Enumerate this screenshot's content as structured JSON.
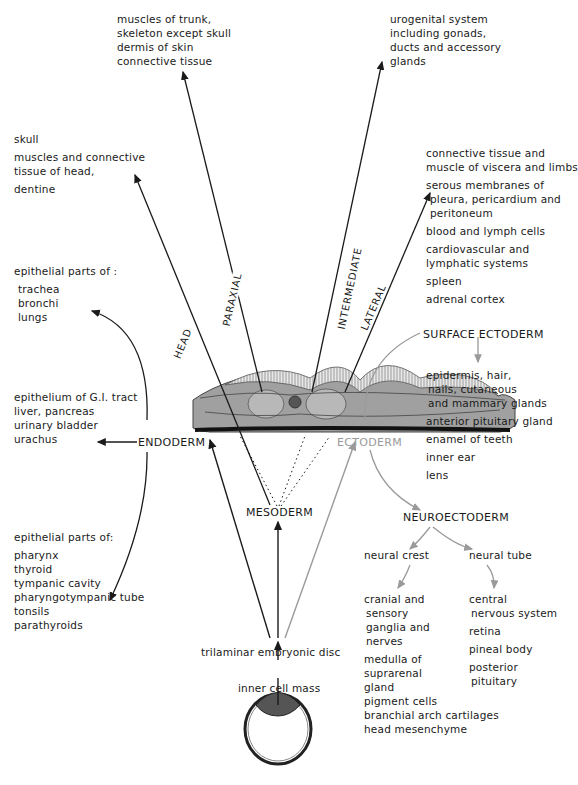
{
  "diagram": {
    "caption": "Derivatives of the germ layers from the inner cell mass via the trilaminar embryonic disc",
    "source_nodes": {
      "inner_cell_mass": "inner cell mass",
      "trilaminar_disc": "trilaminar embryonic disc"
    },
    "germ_layers": {
      "endoderm": "ENDODERM",
      "mesoderm": "MESODERM",
      "ectoderm": "ECTODERM"
    },
    "mesoderm_branches": {
      "head": "HEAD",
      "paraxial": "PARAXIAL",
      "intermediate": "INTERMEDIATE",
      "lateral": "LATERAL"
    },
    "mesoderm_derivatives": {
      "paraxial": [
        "muscles of trunk,",
        "skeleton except skull",
        "dermis of skin",
        "connective tissue"
      ],
      "intermediate": [
        "urogenital system",
        "including gonads,",
        "ducts and accessory",
        "glands"
      ],
      "head": [
        "skull",
        "muscles and connective",
        "tissue of head,",
        "dentine"
      ],
      "lateral": [
        [
          "connective tissue and",
          "muscle of viscera and limbs"
        ],
        [
          "serous membranes of",
          "pleura, pericardium and",
          "peritoneum"
        ],
        [
          "blood and lymph cells"
        ],
        [
          "cardiovascular and",
          "lymphatic systems"
        ],
        [
          "spleen"
        ],
        [
          "adrenal cortex"
        ]
      ]
    },
    "endoderm_derivatives": {
      "respiratory": {
        "heading": "epithelial parts of :",
        "items": [
          "trachea",
          "bronchi",
          "lungs"
        ]
      },
      "gut": [
        "epithelium of G.I. tract",
        "liver, pancreas",
        "urinary bladder",
        "urachus"
      ],
      "pharyngeal": {
        "heading": "epithelial parts of:",
        "items": [
          "pharynx",
          "thyroid",
          "tympanic cavity",
          "pharyngotympanic tube",
          "tonsils",
          "parathyroids"
        ]
      }
    },
    "ectoderm": {
      "surface": {
        "label": "SURFACE ECTODERM",
        "derivatives": [
          [
            "epidermis, hair,",
            "nails, cutaneous",
            "and mammary glands"
          ],
          [
            "anterior pituitary gland"
          ],
          [
            "enamel of teeth"
          ],
          [
            "inner ear"
          ],
          [
            "lens"
          ]
        ]
      },
      "neuro": {
        "label": "NEUROECTODERM",
        "neural_crest": {
          "label": "neural crest",
          "derivatives": [
            [
              "cranial and",
              "sensory",
              "ganglia and",
              "nerves"
            ],
            [
              "medulla of",
              "suprarenal",
              "gland"
            ],
            [
              "pigment cells"
            ],
            [
              "branchial arch cartilages"
            ],
            [
              "head mesenchyme"
            ]
          ]
        },
        "neural_tube": {
          "label": "neural tube",
          "derivatives": [
            [
              "central",
              "nervous system"
            ],
            [
              "retina"
            ],
            [
              "pineal body"
            ],
            [
              "posterior",
              "pituitary"
            ]
          ]
        }
      }
    },
    "colors": {
      "ink": "#1a1a1a",
      "ectoderm_grey": "#9a9a9a",
      "disc_fill": "#9c9c9c",
      "somite_fill": "#b5b5b5"
    }
  }
}
